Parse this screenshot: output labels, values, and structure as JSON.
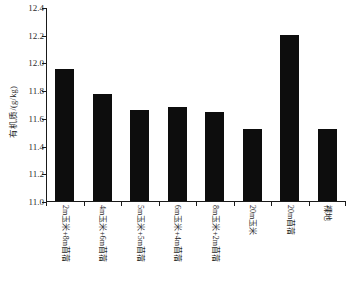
{
  "chart_data": {
    "type": "bar",
    "title": "",
    "subtitle": "",
    "xlabel": "",
    "ylabel": "有机质/(g/kg)",
    "ylim": [
      11.0,
      12.4
    ],
    "ytick_step": 0.2,
    "ytick_labels": [
      "12.4",
      "12.2",
      "12.0",
      "11.8",
      "11.6",
      "11.4",
      "11.2",
      "11.0"
    ],
    "ytick_values": [
      12.4,
      12.2,
      12.0,
      11.8,
      11.6,
      11.4,
      11.2,
      11.0
    ],
    "grid": false,
    "legend": null,
    "bar_color": "#0d0d0d",
    "axis_color": "#1a1a1a",
    "categories": [
      "2m玉米+8m苜蓿",
      "4m玉米+6m苜蓿",
      "5m玉米+5m苜蓿",
      "6m玉米+4m苜蓿",
      "8m玉米+2m苜蓿",
      "20m玉米",
      "20m苜蓿",
      "裸地"
    ],
    "values": [
      11.95,
      11.77,
      11.66,
      11.68,
      11.64,
      11.52,
      12.2,
      11.52
    ]
  }
}
